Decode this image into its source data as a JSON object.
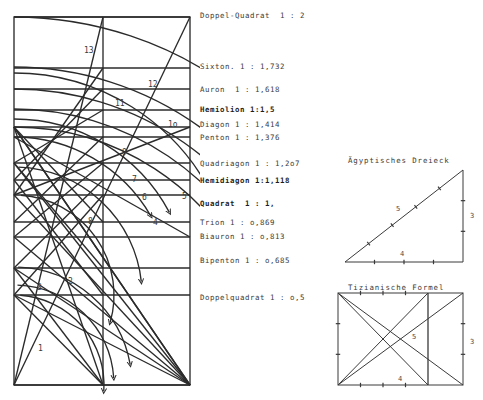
{
  "page": {
    "background": "#ffffff",
    "ink": "#2b2b2b"
  },
  "main_diagram": {
    "name": "doppel-quadrat-construction",
    "rect": {
      "x": 14,
      "y": 17,
      "width": 176,
      "height": 368
    },
    "center_vertical_x": 103,
    "horizontal_lines_y": [
      17,
      68,
      89,
      110,
      127,
      137,
      163,
      180,
      195,
      222,
      237,
      268,
      295,
      385
    ],
    "arc_labels": [
      {
        "id": "13",
        "x": 84,
        "y": 46
      },
      {
        "id": "12",
        "x": 148,
        "y": 80
      },
      {
        "id": "11",
        "x": 115,
        "y": 99
      },
      {
        "id": "1o",
        "x": 168,
        "y": 120
      },
      {
        "id": "9",
        "x": 122,
        "y": 148
      },
      {
        "id": "7",
        "x": 132,
        "y": 175
      },
      {
        "id": "6",
        "x": 142,
        "y": 193
      },
      {
        "id": "5",
        "x": 182,
        "y": 192
      },
      {
        "id": "8",
        "x": 88,
        "y": 217
      },
      {
        "id": "4",
        "x": 153,
        "y": 218
      },
      {
        "id": "3",
        "x": 37,
        "y": 283
      },
      {
        "id": "2",
        "x": 68,
        "y": 277
      },
      {
        "id": "1",
        "x": 38,
        "y": 344
      }
    ]
  },
  "ratio_labels": [
    {
      "text": "Doppel-Quadrat  1 : 2",
      "x": 200,
      "y": 11,
      "bold": false
    },
    {
      "text": "Sixton. 1 : 1,732",
      "x": 200,
      "y": 62,
      "bold": false
    },
    {
      "text": "Auron  1 : 1,618",
      "x": 200,
      "y": 85,
      "bold": false
    },
    {
      "text": "Hemiolion 1:1,5",
      "x": 200,
      "y": 105,
      "bold": true
    },
    {
      "text": "Diagon 1 : 1,414",
      "x": 200,
      "y": 120,
      "bold": false
    },
    {
      "text": "Penton 1 : 1,376",
      "x": 200,
      "y": 133,
      "bold": false
    },
    {
      "text": "Quadriagon 1 : 1,2o7",
      "x": 200,
      "y": 159,
      "bold": false
    },
    {
      "text": "Hemidiagon 1:1,118",
      "x": 200,
      "y": 176,
      "bold": true
    },
    {
      "text": "Quadrat  1 : 1,",
      "x": 200,
      "y": 199,
      "bold": true
    },
    {
      "text": "Trion 1 : o,869",
      "x": 200,
      "y": 218,
      "bold": false
    },
    {
      "text": "Biauron 1 : o,813",
      "x": 200,
      "y": 232,
      "bold": false
    },
    {
      "text": "Bipenton 1 : o,685",
      "x": 200,
      "y": 256,
      "bold": false
    },
    {
      "text": "Doppelquadrat 1 : o,5",
      "x": 200,
      "y": 293,
      "bold": false
    }
  ],
  "triangle_figure": {
    "caption": "Ägyptisches Dreieck",
    "caption_x": 348,
    "caption_y": 156,
    "vertices": {
      "left": [
        345,
        262
      ],
      "right": [
        463,
        262
      ],
      "top": [
        463,
        170
      ]
    },
    "side_labels": [
      {
        "text": "5",
        "x": 396,
        "y": 205
      },
      {
        "text": "3",
        "x": 470,
        "y": 212
      },
      {
        "text": "4",
        "x": 400,
        "y": 250
      }
    ],
    "base_ticks": 4,
    "height_ticks": 3,
    "hyp_ticks": 5
  },
  "tizian_figure": {
    "caption": "Tizianische Formel",
    "caption_x": 348,
    "caption_y": 283,
    "rect": {
      "x": 338,
      "y": 293,
      "width": 125,
      "height": 92
    },
    "inner_vertical_x": 428,
    "side_labels": [
      {
        "text": "5",
        "x": 412,
        "y": 333
      },
      {
        "text": "3",
        "x": 470,
        "y": 338
      },
      {
        "text": "4",
        "x": 398,
        "y": 375
      }
    ],
    "top_ticks": 4,
    "right_ticks": 3,
    "bottom_ticks": 4,
    "left_ticks": 3
  }
}
